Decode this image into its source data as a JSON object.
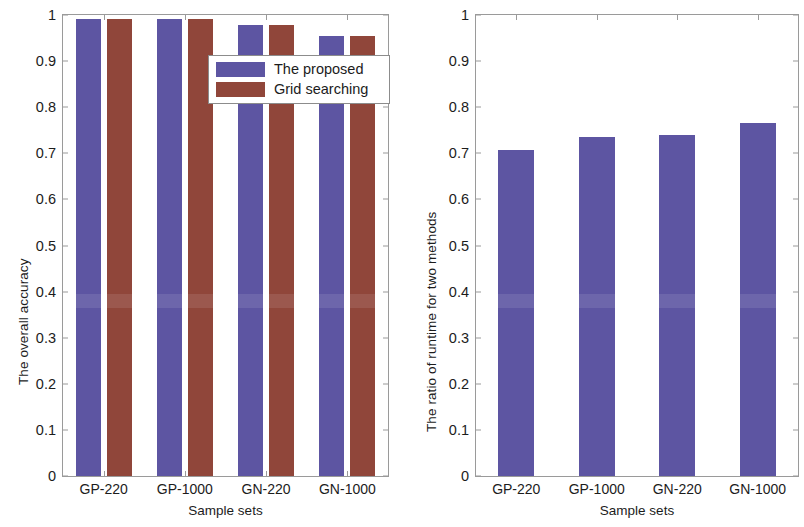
{
  "figure": {
    "background_color": "#ffffff",
    "series_colors": {
      "proposed": "#5d55a2",
      "grid_searching": "#90463a"
    }
  },
  "panels": [
    {
      "id": "overall-accuracy",
      "ylabel": "The overall accuracy",
      "xlabel": "Sample sets",
      "ytick_labels": [
        "0",
        "0.1",
        "0.2",
        "0.3",
        "0.4",
        "0.5",
        "0.6",
        "0.7",
        "0.8",
        "0.9",
        "1"
      ],
      "xtick_labels": [
        "GP-220",
        "GP-1000",
        "GN-220",
        "GN-1000"
      ],
      "legend": {
        "entries": [
          {
            "label": "The proposed",
            "color": "#5d55a2"
          },
          {
            "label": "Grid searching",
            "color": "#90463a"
          }
        ]
      }
    },
    {
      "id": "runtime-ratio",
      "ylabel": "The ratio of runtime for two methods",
      "xlabel": "Sample sets",
      "ytick_labels": [
        "0",
        "0.1",
        "0.2",
        "0.3",
        "0.4",
        "0.5",
        "0.6",
        "0.7",
        "0.8",
        "0.9",
        "1"
      ],
      "xtick_labels": [
        "GP-220",
        "GP-1000",
        "GN-220",
        "GN-1000"
      ]
    }
  ],
  "chart_data": [
    {
      "type": "bar",
      "id": "overall-accuracy",
      "title": "",
      "xlabel": "Sample sets",
      "ylabel": "The overall accuracy",
      "categories": [
        "GP-220",
        "GP-1000",
        "GN-220",
        "GN-1000"
      ],
      "ylim": [
        0,
        1
      ],
      "yticks": [
        0,
        0.1,
        0.2,
        0.3,
        0.4,
        0.5,
        0.6,
        0.7,
        0.8,
        0.9,
        1
      ],
      "grid": false,
      "legend_position": "upper-right-inside",
      "series": [
        {
          "name": "The proposed",
          "color": "#5d55a2",
          "values": [
            0.992,
            0.992,
            0.978,
            0.955
          ]
        },
        {
          "name": "Grid searching",
          "color": "#90463a",
          "values": [
            0.992,
            0.992,
            0.978,
            0.955
          ]
        }
      ]
    },
    {
      "type": "bar",
      "id": "runtime-ratio",
      "title": "",
      "xlabel": "Sample sets",
      "ylabel": "The ratio of runtime for two methods",
      "categories": [
        "GP-220",
        "GP-1000",
        "GN-220",
        "GN-1000"
      ],
      "ylim": [
        0,
        1
      ],
      "yticks": [
        0,
        0.1,
        0.2,
        0.3,
        0.4,
        0.5,
        0.6,
        0.7,
        0.8,
        0.9,
        1
      ],
      "grid": false,
      "legend_position": "none",
      "series": [
        {
          "name": "Ratio of runtime",
          "color": "#5d55a2",
          "values": [
            0.708,
            0.735,
            0.74,
            0.766
          ]
        }
      ]
    }
  ]
}
